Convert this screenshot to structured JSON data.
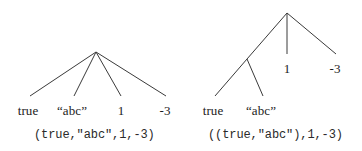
{
  "figure": {
    "background_color": "#ffffff",
    "line_color": "#3a3a3a",
    "text_color": "#1b1b1b"
  },
  "left_tree": {
    "name": "flat-tuple-tree",
    "caption": "(true,\"abc\",1,-3)",
    "root": {
      "x": 96,
      "y": 52
    },
    "leaves": [
      {
        "label": "true",
        "x": 28,
        "y": 104,
        "anchor_x": 30,
        "anchor_y": 96
      },
      {
        "label": "“abc”",
        "x": 72,
        "y": 104,
        "anchor_x": 74,
        "anchor_y": 96
      },
      {
        "label": "1",
        "x": 121,
        "y": 104,
        "anchor_x": 121,
        "anchor_y": 96
      },
      {
        "label": "-3",
        "x": 165,
        "y": 104,
        "anchor_x": 166,
        "anchor_y": 96
      }
    ],
    "edges": [
      {
        "from": "root",
        "to": "true"
      },
      {
        "from": "root",
        "to": "abc"
      },
      {
        "from": "root",
        "to": "1"
      },
      {
        "from": "root",
        "to": "-3"
      }
    ]
  },
  "right_tree": {
    "name": "nested-tuple-tree",
    "caption": "((true,\"abc\"),1,-3)",
    "root": {
      "x": 106,
      "y": 13
    },
    "inner_node": {
      "x": 66,
      "y": 59
    },
    "leaves": [
      {
        "label": "true",
        "x": 32,
        "y": 104,
        "anchor_x": 34,
        "anchor_y": 96
      },
      {
        "label": "“abc”",
        "x": 80,
        "y": 104,
        "anchor_x": 82,
        "anchor_y": 96
      },
      {
        "label": "1",
        "x": 106,
        "y": 62,
        "anchor_x": 106,
        "anchor_y": 54
      },
      {
        "label": "-3",
        "x": 154,
        "y": 62,
        "anchor_x": 155,
        "anchor_y": 54
      }
    ],
    "edges": [
      {
        "from": "root",
        "to": "inner_node"
      },
      {
        "from": "root",
        "to": "1"
      },
      {
        "from": "root",
        "to": "-3"
      },
      {
        "from": "inner_node",
        "to": "true"
      },
      {
        "from": "inner_node",
        "to": "abc"
      }
    ]
  },
  "captions": {
    "left": {
      "x": 34,
      "y": 128
    },
    "right": {
      "x": 27,
      "y": 128
    }
  }
}
